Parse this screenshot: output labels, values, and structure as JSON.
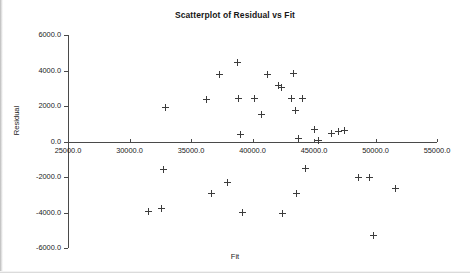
{
  "chart_data": {
    "type": "scatter",
    "title": "Scatterplot of Residual vs Fit",
    "xlabel": "Fit",
    "ylabel": "Residual",
    "xlim": [
      25000.0,
      55000.0
    ],
    "ylim": [
      -6000.0,
      6000.0
    ],
    "grid": false,
    "legend": null,
    "x_ticks": [
      {
        "value": 25000.0,
        "label": "25000.0"
      },
      {
        "value": 30000.0,
        "label": "30000.0"
      },
      {
        "value": 35000.0,
        "label": "35000.0"
      },
      {
        "value": 40000.0,
        "label": "40000.0"
      },
      {
        "value": 45000.0,
        "label": "45000.0"
      },
      {
        "value": 50000.0,
        "label": "50000.0"
      },
      {
        "value": 55000.0,
        "label": "55000.0"
      }
    ],
    "y_ticks": [
      {
        "value": 6000.0,
        "label": "6000.0"
      },
      {
        "value": 4000.0,
        "label": "4000.0"
      },
      {
        "value": 2000.0,
        "label": "2000.0"
      },
      {
        "value": 0.0,
        "label": "0.0"
      },
      {
        "value": -2000.0,
        "label": "-2000.0"
      },
      {
        "value": -4000.0,
        "label": "-4000.0"
      },
      {
        "value": -6000.0,
        "label": "-6000.0"
      }
    ],
    "marker": "plus",
    "marker_color": "#3c3c3c",
    "points": [
      {
        "x": 38750,
        "y": 4450
      },
      {
        "x": 37300,
        "y": 3750
      },
      {
        "x": 41200,
        "y": 3800
      },
      {
        "x": 43350,
        "y": 3850
      },
      {
        "x": 42100,
        "y": 3150
      },
      {
        "x": 42350,
        "y": 3050
      },
      {
        "x": 36250,
        "y": 2350
      },
      {
        "x": 38900,
        "y": 2450
      },
      {
        "x": 40200,
        "y": 2450
      },
      {
        "x": 43150,
        "y": 2400
      },
      {
        "x": 44100,
        "y": 2400
      },
      {
        "x": 43500,
        "y": 1750
      },
      {
        "x": 32900,
        "y": 1900
      },
      {
        "x": 40750,
        "y": 1500
      },
      {
        "x": 39000,
        "y": 400
      },
      {
        "x": 45050,
        "y": 700
      },
      {
        "x": 46450,
        "y": 450
      },
      {
        "x": 47450,
        "y": 600
      },
      {
        "x": 47000,
        "y": 550
      },
      {
        "x": 43700,
        "y": 150
      },
      {
        "x": 45400,
        "y": 80
      },
      {
        "x": 32800,
        "y": -1600
      },
      {
        "x": 44300,
        "y": -1500
      },
      {
        "x": 38000,
        "y": -2300
      },
      {
        "x": 48600,
        "y": -2050
      },
      {
        "x": 49550,
        "y": -2000
      },
      {
        "x": 36700,
        "y": -2950
      },
      {
        "x": 43600,
        "y": -2950
      },
      {
        "x": 51600,
        "y": -2650
      },
      {
        "x": 31550,
        "y": -3950
      },
      {
        "x": 32600,
        "y": -3800
      },
      {
        "x": 39150,
        "y": -4000
      },
      {
        "x": 42450,
        "y": -4050
      },
      {
        "x": 49850,
        "y": -5300
      }
    ]
  },
  "axes_geometry": {
    "x_pixel_min": 68,
    "x_pixel_max": 437,
    "y_pixel_min": 35,
    "y_pixel_max": 248
  }
}
